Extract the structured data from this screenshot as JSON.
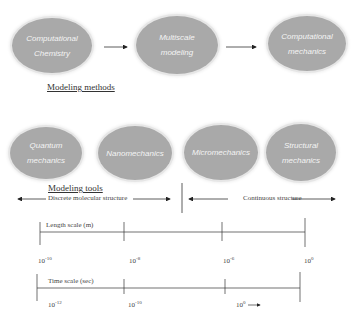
{
  "methods": {
    "heading": "Modeling methods",
    "nodes": [
      {
        "label": "Computational\nChemistry"
      },
      {
        "label": "Multiscale\nmodeling"
      },
      {
        "label": "Computational\nmechanics"
      }
    ]
  },
  "tools": {
    "heading": "Modeling tools",
    "nodes": [
      {
        "label": "Quantum\nmechanics"
      },
      {
        "label": "Nanomechanics"
      },
      {
        "label": "Micromechanics"
      },
      {
        "label": "Structural\nmechanics"
      }
    ]
  },
  "structure": {
    "discrete": "Discrete molecular structure",
    "continuous": "Continuous structure"
  },
  "length_scale": {
    "label": "Length scale (m)",
    "ticks": [
      {
        "base": "10",
        "exp": "-10"
      },
      {
        "base": "10",
        "exp": "-8"
      },
      {
        "base": "10",
        "exp": "-6"
      },
      {
        "base": "10",
        "exp": "0"
      }
    ]
  },
  "time_scale": {
    "label": "Time scale (sec)",
    "ticks": [
      {
        "base": "10",
        "exp": "-12"
      },
      {
        "base": "10",
        "exp": "-10"
      },
      {
        "base": "10",
        "exp": "0"
      }
    ]
  }
}
